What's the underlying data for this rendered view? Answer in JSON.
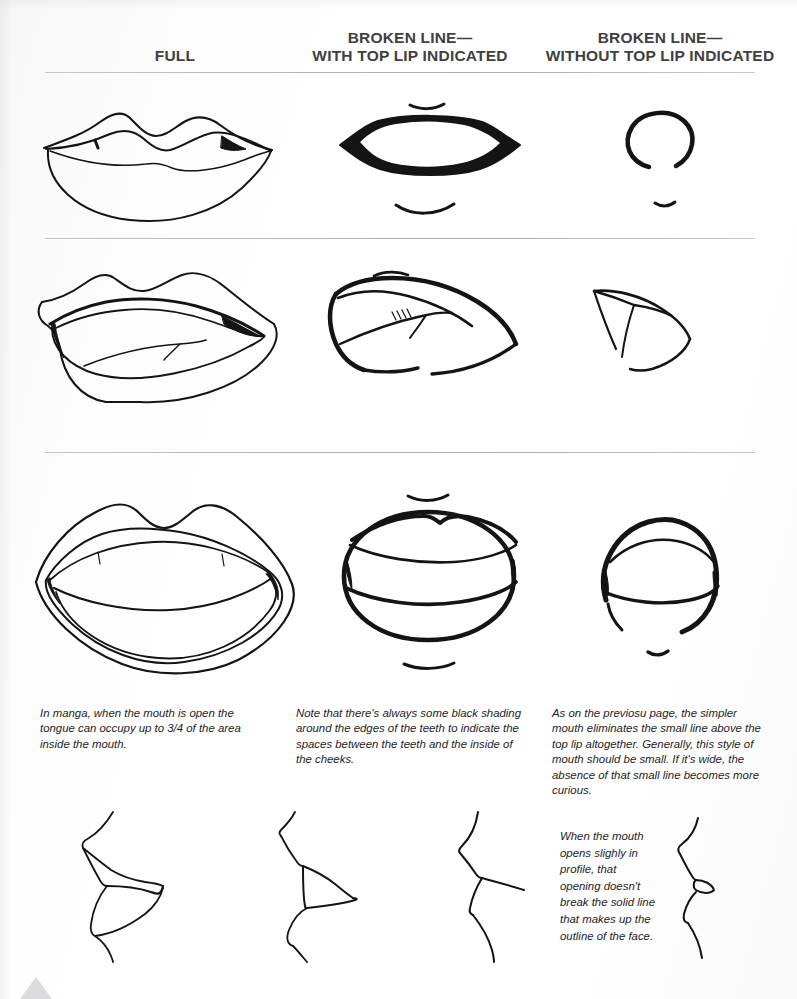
{
  "page": {
    "background_color": "#ffffff",
    "ink_color": "#141414",
    "rule_color": "#b9b9be"
  },
  "columns": [
    {
      "id": "full",
      "line1": "FULL",
      "line2": ""
    },
    {
      "id": "with",
      "line1": "BROKEN LINE—",
      "line2": "WITH TOP LIP INDICATED"
    },
    {
      "id": "without",
      "line1": "BROKEN LINE—",
      "line2": "WITHOUT TOP LIP INDICATED"
    }
  ],
  "figures": {
    "row1": [
      {
        "name": "full-closed-lips",
        "alt": "Full rendered closed lips with cupid's bow"
      },
      {
        "name": "broken-line-closed-mouth",
        "alt": "Broken line mouth with thick top lip and black corner shading"
      },
      {
        "name": "simple-open-mouth-small",
        "alt": "Small rounded open mouth without top lip line"
      }
    ],
    "row2": [
      {
        "name": "full-open-lips-tongue",
        "alt": "Full lips slightly open showing tongue"
      },
      {
        "name": "broken-line-open-angled",
        "alt": "Angled broken line mouth with hatched teeth"
      },
      {
        "name": "simple-open-mouth-angled",
        "alt": "Simple angular open mouth"
      }
    ],
    "row3": [
      {
        "name": "full-wide-open-lips",
        "alt": "Full lips wide open showing teeth and tongue"
      },
      {
        "name": "broken-line-wide-open",
        "alt": "Broken line wide open mouth with teeth band"
      },
      {
        "name": "simple-wide-open-mouth",
        "alt": "Simple wide open mouth without top lip line"
      }
    ],
    "row4": [
      {
        "name": "profile-lips-full",
        "alt": "Profile of lips, detailed"
      },
      {
        "name": "profile-lips-open",
        "alt": "Profile of lips slightly open"
      },
      {
        "name": "profile-lips-simple",
        "alt": "Profile of lips, simple line"
      },
      {
        "name": "profile-lips-minimal",
        "alt": "Minimal profile line beside caption"
      }
    ]
  },
  "captions": {
    "c1": "In manga, when the mouth is open the tongue can occupy up to 3/4 of the area inside the mouth.",
    "c2": "Note that there's always some black shading around the edges of the teeth to indicate the spaces between the teeth and the inside of the cheeks.",
    "c3": "As on the previosu page, the simpler mouth eliminates the small line above the top lip altogether. Generally, this style of mouth should be small. If it's wide, the absence of that small line becomes more curious.",
    "c4": "When the mouth opens slighly in profile, that opening doesn't break the solid line that makes up the outline of the face."
  }
}
